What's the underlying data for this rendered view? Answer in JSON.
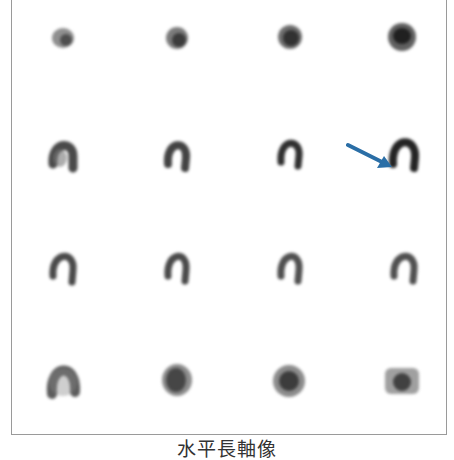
{
  "figure": {
    "title": "水平長軸像",
    "rows": 4,
    "cols": 4,
    "frame_color": "#9a9a9a",
    "arrow": {
      "color": "#2a6ea6",
      "direction": "down-right",
      "row": 2,
      "col": 4
    },
    "panels": [
      {
        "row": 1,
        "col": 1,
        "shape": "small-spot"
      },
      {
        "row": 1,
        "col": 2,
        "shape": "small-spot"
      },
      {
        "row": 1,
        "col": 3,
        "shape": "spot"
      },
      {
        "row": 1,
        "col": 4,
        "shape": "spot"
      },
      {
        "row": 2,
        "col": 1,
        "shape": "horseshoe-thick"
      },
      {
        "row": 2,
        "col": 2,
        "shape": "horseshoe"
      },
      {
        "row": 2,
        "col": 3,
        "shape": "horseshoe"
      },
      {
        "row": 2,
        "col": 4,
        "shape": "horseshoe"
      },
      {
        "row": 3,
        "col": 1,
        "shape": "horseshoe-thin"
      },
      {
        "row": 3,
        "col": 2,
        "shape": "horseshoe-thin"
      },
      {
        "row": 3,
        "col": 3,
        "shape": "horseshoe-thin"
      },
      {
        "row": 3,
        "col": 4,
        "shape": "horseshoe-thin"
      },
      {
        "row": 4,
        "col": 1,
        "shape": "horseshoe-wide"
      },
      {
        "row": 4,
        "col": 2,
        "shape": "filled-blob"
      },
      {
        "row": 4,
        "col": 3,
        "shape": "filled-blob"
      },
      {
        "row": 4,
        "col": 4,
        "shape": "filled-square"
      }
    ]
  }
}
